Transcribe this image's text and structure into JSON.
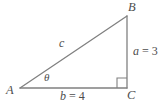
{
  "figure": {
    "type": "right-triangle-diagram",
    "background_color": "#ffffff",
    "stroke_color": "#808080",
    "text_color": "#4d4d4d",
    "vertices": {
      "A": {
        "label": "A",
        "x": 20,
        "y": 88
      },
      "B": {
        "label": "B",
        "x": 127,
        "y": 16
      },
      "C": {
        "label": "C",
        "x": 127,
        "y": 88
      }
    },
    "sides": {
      "hypotenuse": {
        "label": "c",
        "from": "A",
        "to": "B"
      },
      "opposite": {
        "label": "a",
        "value": "3",
        "equals": "=",
        "text": "a = 3",
        "from": "B",
        "to": "C"
      },
      "adjacent": {
        "label": "b",
        "value": "4",
        "equals": "=",
        "text": "b = 4",
        "from": "A",
        "to": "C"
      }
    },
    "angles": {
      "at_A": {
        "label": "θ",
        "name": "theta"
      },
      "at_C": {
        "label": "right-angle",
        "marker": "square",
        "degrees": 90
      }
    }
  }
}
